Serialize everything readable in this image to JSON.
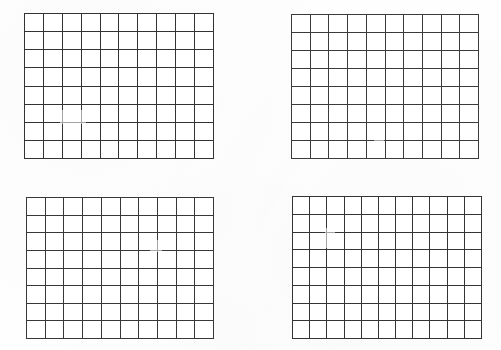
{
  "page": {
    "background_color": "#fefefe",
    "line_color": "#3a3a3a",
    "width": 501,
    "height": 350
  },
  "grids": [
    {
      "id": "grid-top-left",
      "label": "Top left grid",
      "columns": 10,
      "rows": 8,
      "cell_count": 80,
      "x": 24,
      "y": 13,
      "width": 190,
      "height": 146,
      "cells_filled": false,
      "content": ""
    },
    {
      "id": "grid-top-right",
      "label": "Top right grid",
      "columns": 10,
      "rows": 8,
      "cell_count": 80,
      "x": 291,
      "y": 14,
      "width": 188,
      "height": 145,
      "cells_filled": false,
      "content": ""
    },
    {
      "id": "grid-bottom-left",
      "label": "Bottom left grid",
      "columns": 10,
      "rows": 8,
      "cell_count": 80,
      "x": 26,
      "y": 197,
      "width": 188,
      "height": 142,
      "cells_filled": false,
      "content": ""
    },
    {
      "id": "grid-bottom-right",
      "label": "Bottom right grid",
      "columns": 11,
      "rows": 8,
      "cell_count": 88,
      "x": 292,
      "y": 196,
      "width": 190,
      "height": 143,
      "cells_filled": false,
      "content": ""
    }
  ]
}
